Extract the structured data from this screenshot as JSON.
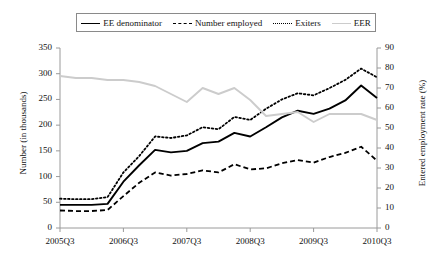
{
  "legend": {
    "position": "top-center",
    "entries": [
      {
        "label": "EE denominator",
        "style": "solid",
        "color": "#000000",
        "icon": "line-solid-icon"
      },
      {
        "label": "Number employed",
        "style": "dashed",
        "color": "#000000",
        "icon": "line-dashed-icon"
      },
      {
        "label": "Exiters",
        "style": "dotted",
        "color": "#000000",
        "icon": "line-dotted-icon"
      },
      {
        "label": "EER",
        "style": "solid",
        "color": "#cccccc",
        "icon": "line-gray-icon"
      }
    ]
  },
  "axes": {
    "y_left_title": "Number (in thousands)",
    "y_right_title": "Entered employment rate (%)",
    "y_left_ticks": [
      "0",
      "50",
      "100",
      "150",
      "200",
      "250",
      "300",
      "350"
    ],
    "y_right_ticks": [
      "0",
      "10",
      "20",
      "30",
      "40",
      "50",
      "60",
      "70",
      "80",
      "90"
    ],
    "x_ticks": [
      "2005Q3",
      "2006Q3",
      "2007Q3",
      "2008Q3",
      "2009Q3",
      "2010Q3"
    ]
  },
  "chart_data": {
    "type": "line",
    "title": "",
    "subtitle": "",
    "xlabel": "",
    "ylabel": "Number (in thousands)",
    "y2label": "Entered employment rate (%)",
    "ylim": [
      0,
      350
    ],
    "y2lim": [
      0,
      90
    ],
    "grid": false,
    "legend_position": "top-center",
    "x": [
      "2005Q3",
      "2005Q4",
      "2006Q1",
      "2006Q2",
      "2006Q3",
      "2006Q4",
      "2007Q1",
      "2007Q2",
      "2007Q3",
      "2007Q4",
      "2008Q1",
      "2008Q2",
      "2008Q3",
      "2008Q4",
      "2009Q1",
      "2009Q2",
      "2009Q3",
      "2009Q4",
      "2010Q1",
      "2010Q2",
      "2010Q3"
    ],
    "x_tick_labels": [
      "2005Q3",
      "2006Q3",
      "2007Q3",
      "2008Q3",
      "2009Q3",
      "2010Q3"
    ],
    "series": [
      {
        "name": "EE denominator",
        "axis": "left",
        "style": "solid",
        "color": "#000000",
        "unit": "thousands",
        "values": [
          45,
          45,
          45,
          47,
          90,
          122,
          152,
          147,
          150,
          165,
          168,
          185,
          178,
          196,
          215,
          228,
          222,
          232,
          248,
          277,
          253
        ]
      },
      {
        "name": "Number employed",
        "axis": "left",
        "style": "dashed",
        "color": "#000000",
        "unit": "thousands",
        "values": [
          34,
          33,
          33,
          35,
          62,
          88,
          108,
          102,
          105,
          112,
          108,
          124,
          114,
          116,
          126,
          132,
          127,
          138,
          146,
          158,
          131
        ]
      },
      {
        "name": "Exiters",
        "axis": "left",
        "style": "dotted",
        "color": "#000000",
        "unit": "thousands",
        "values": [
          57,
          56,
          56,
          60,
          108,
          140,
          178,
          175,
          180,
          196,
          192,
          216,
          210,
          232,
          250,
          262,
          258,
          272,
          288,
          310,
          293
        ]
      },
      {
        "name": "EER",
        "axis": "right",
        "style": "solid",
        "color": "#cccccc",
        "unit": "percent",
        "values": [
          76,
          75,
          75,
          74,
          74,
          73,
          71,
          67,
          63,
          70,
          67,
          70,
          64,
          56,
          57,
          58,
          53,
          57,
          57,
          57,
          54
        ]
      }
    ]
  }
}
